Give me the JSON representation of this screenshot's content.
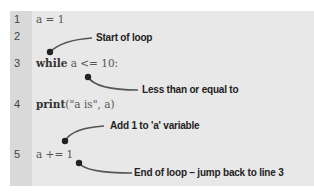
{
  "line_numbers": [
    "1",
    "2",
    "3",
    "4",
    "5"
  ],
  "code": {
    "line1": "a = 1",
    "line3_kw": "while",
    "line3_rest": " a <= 10:",
    "line4_kw": "print",
    "line4_rest": "(\"a is\", a)",
    "line5": "a += 1"
  },
  "annotations": {
    "start_of_loop": "Start of loop",
    "less_than": "Less than or equal to",
    "add_one": "Add 1 to 'a' variable",
    "end_of_loop": "End of loop – jump back to line 3"
  },
  "colors": {
    "panel": "#e8e8e8",
    "gutter": "#d9d9d9",
    "dot": "#222222"
  }
}
